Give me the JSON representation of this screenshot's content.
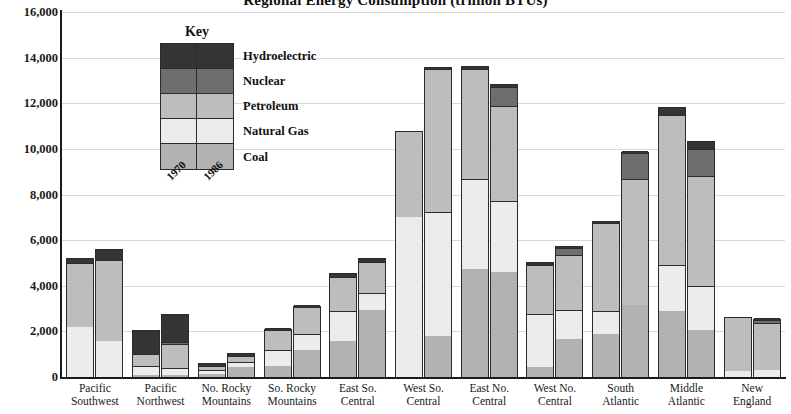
{
  "chart_data": {
    "type": "bar",
    "subtype": "stacked-grouped",
    "title": "Regional Energy Consumption (trillion BTUs)",
    "xlabel": "",
    "ylabel": "",
    "ylim": [
      0,
      16000
    ],
    "ytick_step": 2000,
    "yticks": [
      "0",
      "2,000",
      "4,000",
      "6,000",
      "8,000",
      "10,000",
      "12,000",
      "14,000",
      "16,000"
    ],
    "ytick_values": [
      0,
      2000,
      4000,
      6000,
      8000,
      10000,
      12000,
      14000,
      16000
    ],
    "grid": true,
    "grid_axis": "y",
    "legend_title": "Key",
    "legend_position": "inside-upper-left",
    "group_labels": [
      "1970",
      "1986"
    ],
    "stack_order_bottom_to_top": [
      "Coal",
      "Natural Gas",
      "Petroleum",
      "Nuclear",
      "Hydroelectric"
    ],
    "series_colors": {
      "Coal": "#b2b2b2",
      "Natural Gas": "#ececec",
      "Petroleum": "#bdbdbd",
      "Nuclear": "#6e6e6e",
      "Hydroelectric": "#343434"
    },
    "categories": [
      "Pacific Southwest",
      "Pacific Northwest",
      "No. Rocky Mountains",
      "So. Rocky Mountains",
      "East So. Central",
      "West So. Central",
      "East No. Central",
      "West No. Central",
      "South Atlantic",
      "Middle Atlantic",
      "New England"
    ],
    "category_label_lines": [
      [
        "Pacific",
        "Southwest"
      ],
      [
        "Pacific",
        "Northwest"
      ],
      [
        "No. Rocky",
        "Mountains"
      ],
      [
        "So. Rocky",
        "Mountains"
      ],
      [
        "East So.",
        "Central"
      ],
      [
        "West So.",
        "Central"
      ],
      [
        "East No.",
        "Central"
      ],
      [
        "West No.",
        "Central"
      ],
      [
        "South",
        "Atlantic"
      ],
      [
        "Middle",
        "Atlantic"
      ],
      [
        "New",
        "England"
      ]
    ],
    "bars": [
      {
        "category": "Pacific Southwest",
        "years": [
          {
            "year": "1970",
            "total": 5200,
            "segments": {
              "Coal": 0,
              "Natural Gas": 2200,
              "Petroleum": 2800,
              "Nuclear": 0,
              "Hydroelectric": 200
            }
          },
          {
            "year": "1986",
            "total": 5600,
            "segments": {
              "Coal": 0,
              "Natural Gas": 1600,
              "Petroleum": 3550,
              "Nuclear": 0,
              "Hydroelectric": 450
            }
          }
        ]
      },
      {
        "category": "Pacific Northwest",
        "years": [
          {
            "year": "1970",
            "total": 2050,
            "segments": {
              "Coal": 100,
              "Natural Gas": 400,
              "Petroleum": 500,
              "Nuclear": 0,
              "Hydroelectric": 1050
            }
          },
          {
            "year": "1986",
            "total": 2750,
            "segments": {
              "Coal": 100,
              "Natural Gas": 300,
              "Petroleum": 1050,
              "Nuclear": 100,
              "Hydroelectric": 1200
            }
          }
        ]
      },
      {
        "category": "No. Rocky Mountains",
        "years": [
          {
            "year": "1970",
            "total": 600,
            "segments": {
              "Coal": 150,
              "Natural Gas": 150,
              "Petroleum": 200,
              "Nuclear": 0,
              "Hydroelectric": 100
            }
          },
          {
            "year": "1986",
            "total": 1050,
            "segments": {
              "Coal": 450,
              "Natural Gas": 200,
              "Petroleum": 250,
              "Nuclear": 0,
              "Hydroelectric": 150
            }
          }
        ]
      },
      {
        "category": "So. Rocky Mountains",
        "years": [
          {
            "year": "1970",
            "total": 2100,
            "segments": {
              "Coal": 500,
              "Natural Gas": 700,
              "Petroleum": 850,
              "Nuclear": 0,
              "Hydroelectric": 50
            }
          },
          {
            "year": "1986",
            "total": 3100,
            "segments": {
              "Coal": 1200,
              "Natural Gas": 700,
              "Petroleum": 1150,
              "Nuclear": 0,
              "Hydroelectric": 50
            }
          }
        ]
      },
      {
        "category": "East So. Central",
        "years": [
          {
            "year": "1970",
            "total": 4550,
            "segments": {
              "Coal": 1600,
              "Natural Gas": 1300,
              "Petroleum": 1500,
              "Nuclear": 0,
              "Hydroelectric": 150
            }
          },
          {
            "year": "1986",
            "total": 5200,
            "segments": {
              "Coal": 2950,
              "Natural Gas": 750,
              "Petroleum": 1350,
              "Nuclear": 0,
              "Hydroelectric": 150
            }
          }
        ]
      },
      {
        "category": "West So. Central",
        "years": [
          {
            "year": "1970",
            "total": 10800,
            "segments": {
              "Coal": 0,
              "Natural Gas": 7000,
              "Petroleum": 3800,
              "Nuclear": 0,
              "Hydroelectric": 0
            }
          },
          {
            "year": "1986",
            "total": 13600,
            "segments": {
              "Coal": 1800,
              "Natural Gas": 5450,
              "Petroleum": 6250,
              "Nuclear": 0,
              "Hydroelectric": 100
            }
          }
        ]
      },
      {
        "category": "East No. Central",
        "years": [
          {
            "year": "1970",
            "total": 13650,
            "segments": {
              "Coal": 4750,
              "Natural Gas": 3950,
              "Petroleum": 4800,
              "Nuclear": 0,
              "Hydroelectric": 150
            }
          },
          {
            "year": "1986",
            "total": 12850,
            "segments": {
              "Coal": 4600,
              "Natural Gas": 3100,
              "Petroleum": 4200,
              "Nuclear": 800,
              "Hydroelectric": 150
            }
          }
        ]
      },
      {
        "category": "West No. Central",
        "years": [
          {
            "year": "1970",
            "total": 5050,
            "segments": {
              "Coal": 450,
              "Natural Gas": 2300,
              "Petroleum": 2150,
              "Nuclear": 0,
              "Hydroelectric": 150
            }
          },
          {
            "year": "1986",
            "total": 5750,
            "segments": {
              "Coal": 1650,
              "Natural Gas": 1300,
              "Petroleum": 2400,
              "Nuclear": 300,
              "Hydroelectric": 100
            }
          }
        ]
      },
      {
        "category": "South Atlantic",
        "years": [
          {
            "year": "1970",
            "total": 6850,
            "segments": {
              "Coal": 1900,
              "Natural Gas": 1000,
              "Petroleum": 3850,
              "Nuclear": 0,
              "Hydroelectric": 100
            }
          },
          {
            "year": "1986",
            "total": 9850,
            "segments": {
              "Coal": 3150,
              "Natural Gas": 0,
              "Petroleum": 5550,
              "Nuclear": 1100,
              "Hydroelectric": 50
            }
          }
        ]
      },
      {
        "category": "Middle Atlantic",
        "years": [
          {
            "year": "1970",
            "total": 11850,
            "segments": {
              "Coal": 2900,
              "Natural Gas": 2000,
              "Petroleum": 6600,
              "Nuclear": 0,
              "Hydroelectric": 350
            }
          },
          {
            "year": "1986",
            "total": 10350,
            "segments": {
              "Coal": 2050,
              "Natural Gas": 1950,
              "Petroleum": 4800,
              "Nuclear": 1200,
              "Hydroelectric": 350
            }
          }
        ]
      },
      {
        "category": "New England",
        "years": [
          {
            "year": "1970",
            "total": 2650,
            "segments": {
              "Coal": 0,
              "Natural Gas": 250,
              "Petroleum": 2400,
              "Nuclear": 0,
              "Hydroelectric": 0
            }
          },
          {
            "year": "1986",
            "total": 2550,
            "segments": {
              "Coal": 0,
              "Natural Gas": 300,
              "Petroleum": 2050,
              "Nuclear": 150,
              "Hydroelectric": 50
            }
          }
        ]
      }
    ]
  }
}
